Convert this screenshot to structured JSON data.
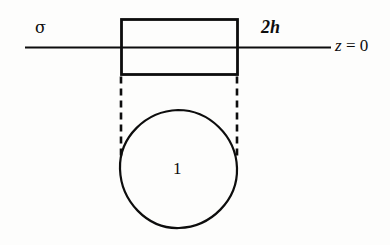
{
  "figure": {
    "background_color": "#fdfdfc",
    "ink_color": "#0d0d0d",
    "width": 390,
    "height": 245
  },
  "labels": {
    "surface_stress": "σ",
    "thickness": "2h",
    "plane": "z = 0",
    "plane_variable": "z",
    "plane_equals_value": " = 0",
    "region": "1"
  },
  "geometry": {
    "baseline": {
      "name": "z-equals-zero-line",
      "x1": 25,
      "y1": 47,
      "x2": 331,
      "y2": 47,
      "stroke_width": 2.2
    },
    "rectangle": {
      "name": "layer-rectangle",
      "x": 121,
      "y": 19,
      "width": 116,
      "height": 55,
      "stroke_width": 2.8,
      "fill": "none"
    },
    "circle": {
      "name": "region-one-circle",
      "cx": 178.5,
      "cy": 169,
      "rx": 58,
      "ry": 59,
      "stroke_width": 2.2,
      "fill": "none"
    },
    "dashed_left": {
      "name": "left-projection-dashed-line",
      "x1": 121,
      "y1": 76,
      "x2": 121,
      "y2": 160,
      "stroke_width": 2.6,
      "dash": "7 5"
    },
    "dashed_right": {
      "name": "right-projection-dashed-line",
      "x1": 237,
      "y1": 76,
      "x2": 237,
      "y2": 160,
      "stroke_width": 2.6,
      "dash": "7 5"
    }
  }
}
